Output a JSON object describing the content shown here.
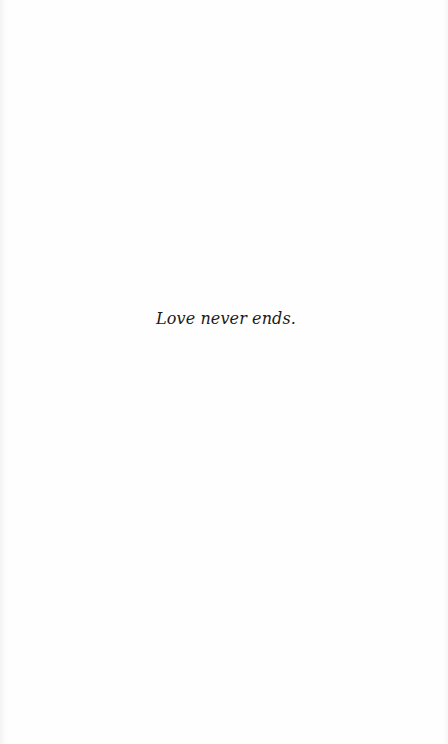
{
  "page": {
    "epigraph": "Love never ends.",
    "background_color": "#fefefe",
    "text_color": "#1a1a1a"
  }
}
